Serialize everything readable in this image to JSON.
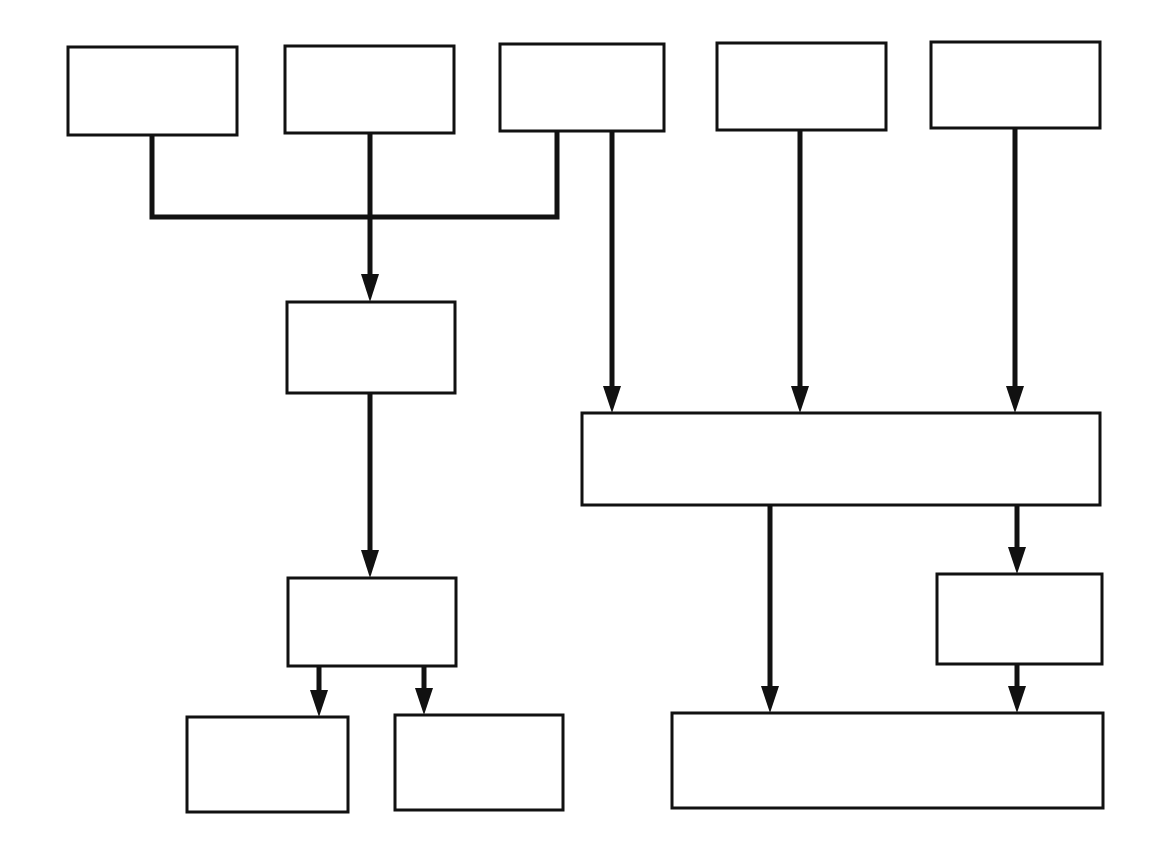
{
  "diagram": {
    "type": "flowchart",
    "title": "",
    "stroke_color": "#111111",
    "background": "#ffffff",
    "nodes": [
      {
        "id": "top-1",
        "label": "",
        "x": 68,
        "y": 47,
        "w": 169,
        "h": 88
      },
      {
        "id": "top-2",
        "label": "",
        "x": 285,
        "y": 46,
        "w": 169,
        "h": 87
      },
      {
        "id": "top-3",
        "label": "",
        "x": 500,
        "y": 44,
        "w": 164,
        "h": 87
      },
      {
        "id": "top-4",
        "label": "",
        "x": 717,
        "y": 43,
        "w": 169,
        "h": 87
      },
      {
        "id": "top-5",
        "label": "",
        "x": 931,
        "y": 42,
        "w": 169,
        "h": 86
      },
      {
        "id": "mid-left-1",
        "label": "",
        "x": 287,
        "y": 302,
        "w": 168,
        "h": 91
      },
      {
        "id": "mid-right-wide",
        "label": "",
        "x": 582,
        "y": 413,
        "w": 518,
        "h": 92
      },
      {
        "id": "mid-left-2",
        "label": "",
        "x": 288,
        "y": 578,
        "w": 168,
        "h": 88
      },
      {
        "id": "mid-right-small",
        "label": "",
        "x": 937,
        "y": 574,
        "w": 165,
        "h": 90
      },
      {
        "id": "bottom-left-1",
        "label": "",
        "x": 187,
        "y": 717,
        "w": 161,
        "h": 95
      },
      {
        "id": "bottom-left-2",
        "label": "",
        "x": 395,
        "y": 715,
        "w": 168,
        "h": 95
      },
      {
        "id": "bottom-right-wide",
        "label": "",
        "x": 672,
        "y": 713,
        "w": 431,
        "h": 95
      }
    ],
    "edges": [
      {
        "from": [
          "top-1",
          "top-2",
          "top-3"
        ],
        "to": "mid-left-1",
        "kind": "merge"
      },
      {
        "from": "top-3",
        "to": "mid-right-wide"
      },
      {
        "from": "top-4",
        "to": "mid-right-wide"
      },
      {
        "from": "top-5",
        "to": "mid-right-wide"
      },
      {
        "from": "mid-left-1",
        "to": "mid-left-2"
      },
      {
        "from": "mid-left-2",
        "to": "bottom-left-1"
      },
      {
        "from": "mid-left-2",
        "to": "bottom-left-2"
      },
      {
        "from": "mid-right-wide",
        "to": "bottom-right-wide"
      },
      {
        "from": "mid-right-wide",
        "to": "mid-right-small"
      },
      {
        "from": "mid-right-small",
        "to": "bottom-right-wide"
      }
    ]
  }
}
